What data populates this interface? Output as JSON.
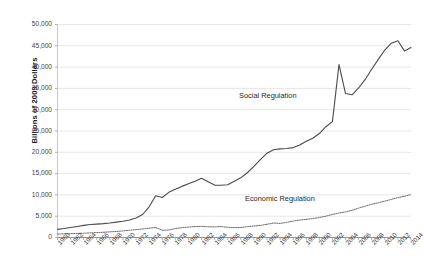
{
  "chart_data": {
    "type": "line",
    "title": "",
    "xlabel": "",
    "ylabel": "Billions of 2009 Dollars",
    "ylim": [
      0,
      50000
    ],
    "ytick_labels": [
      "0",
      "5,000",
      "10,000",
      "15,000",
      "20,000",
      "25,000",
      "30,000",
      "35,000",
      "40,000",
      "45,000",
      "50,000"
    ],
    "ytick_values": [
      0,
      5000,
      10000,
      15000,
      20000,
      25000,
      30000,
      35000,
      40000,
      45000,
      50000
    ],
    "grid": true,
    "legend_position": "inline-annotations",
    "xlim": [
      1960,
      2014
    ],
    "xtick_labels": [
      "1960",
      "1962",
      "1964",
      "1966",
      "1968",
      "1970",
      "1972",
      "1974",
      "1976",
      "1978",
      "1980",
      "1982",
      "1984",
      "1986",
      "1988",
      "1990",
      "1992",
      "1994",
      "1996",
      "1998",
      "2000",
      "2002",
      "2004",
      "2006",
      "2008",
      "2010",
      "2012",
      "2014"
    ],
    "x": [
      1960,
      1961,
      1962,
      1963,
      1964,
      1965,
      1966,
      1967,
      1968,
      1969,
      1970,
      1971,
      1972,
      1973,
      1974,
      1975,
      1976,
      1977,
      1978,
      1979,
      1980,
      1981,
      1982,
      1983,
      1984,
      1985,
      1986,
      1987,
      1988,
      1989,
      1990,
      1991,
      1992,
      1993,
      1994,
      1995,
      1996,
      1997,
      1998,
      1999,
      2000,
      2001,
      2002,
      2003,
      2004,
      2005,
      2006,
      2007,
      2008,
      2009,
      2010,
      2011,
      2012,
      2013,
      2014
    ],
    "series": [
      {
        "name": "Social Regulation",
        "style": "solid",
        "color": "#4a4a4a",
        "values": [
          1900,
          2100,
          2350,
          2600,
          2850,
          3050,
          3150,
          3250,
          3400,
          3600,
          3800,
          4100,
          4600,
          5400,
          7200,
          9800,
          9400,
          10600,
          11300,
          12000,
          12600,
          13200,
          13900,
          13100,
          12300,
          12250,
          12400,
          13200,
          14000,
          15200,
          16700,
          18300,
          19800,
          20600,
          20800,
          20900,
          21100,
          21700,
          22600,
          23300,
          24400,
          26000,
          27200,
          40600,
          33800,
          33500,
          35100,
          37100,
          39500,
          41800,
          44000,
          45600,
          46200,
          43800,
          44600
        ]
      },
      {
        "name": "Economic Regulation",
        "style": "dotted",
        "color": "#5a5a5a",
        "values": [
          800,
          850,
          900,
          950,
          1000,
          1080,
          1150,
          1230,
          1320,
          1420,
          1550,
          1700,
          1850,
          2000,
          2200,
          2350,
          1700,
          1750,
          2100,
          2300,
          2450,
          2560,
          2600,
          2520,
          2480,
          2560,
          2400,
          2330,
          2360,
          2540,
          2700,
          2830,
          3100,
          3400,
          3300,
          3550,
          3850,
          4100,
          4250,
          4450,
          4700,
          5000,
          5400,
          5750,
          6000,
          6400,
          6900,
          7350,
          7800,
          8150,
          8550,
          8950,
          9350,
          9700,
          10050
        ]
      }
    ],
    "annotations": [
      {
        "text": "Social Regulation",
        "x": 1996,
        "y": 30500
      },
      {
        "text": "Economic Regulation",
        "x": 1997,
        "y": 9500
      }
    ]
  }
}
